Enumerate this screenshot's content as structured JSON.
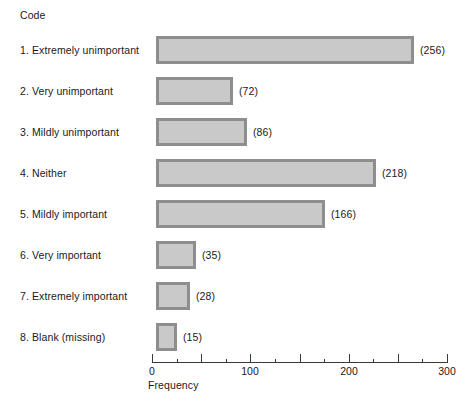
{
  "legend": {
    "code_header": "Code"
  },
  "chart_data": {
    "type": "bar",
    "orientation": "horizontal",
    "title": "",
    "xlabel": "Frequency",
    "ylabel": "Code",
    "xlim": [
      0,
      300
    ],
    "grid": false,
    "legend_position": "none",
    "tick_step_major": 50,
    "tick_step_minor": 25,
    "tick_labels": [
      "0",
      "100",
      "200",
      "300"
    ],
    "tick_label_values": [
      0,
      100,
      200,
      300
    ],
    "categories": [
      "1. Extremely unimportant",
      "2. Very unimportant",
      "3. Mildly unimportant",
      "4. Neither",
      "5. Mildly important",
      "6. Very important",
      "7. Extremely important",
      "8. Blank (missing)"
    ],
    "values": [
      256,
      72,
      86,
      218,
      166,
      35,
      28,
      15
    ],
    "value_labels": [
      "(256)",
      "(72)",
      "(86)",
      "(218)",
      "(166)",
      "(35)",
      "(28)",
      "(15)"
    ],
    "bar_fill_color": "#c9c9c9",
    "bar_border_color": "#8e8e8e",
    "axis_color": "#3a3a3a",
    "background_color": "#ffffff"
  }
}
